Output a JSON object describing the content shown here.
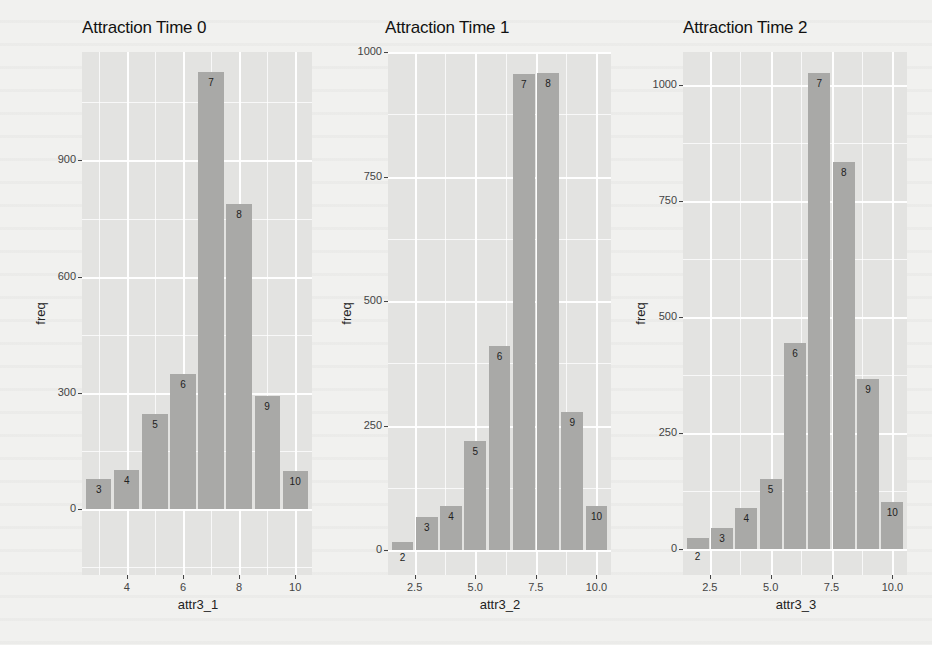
{
  "chart_data": [
    {
      "type": "bar",
      "title": "Attraction Time 0",
      "xlabel": "attr3_1",
      "ylabel": "freq",
      "categories": [
        3,
        4,
        5,
        6,
        7,
        8,
        9,
        10
      ],
      "values": [
        79,
        100,
        245,
        348,
        1129,
        788,
        293,
        98
      ],
      "bar_labels": [
        "3",
        "4",
        "5",
        "6",
        "7",
        "8",
        "9",
        "10"
      ],
      "xticks": [
        "4",
        "6",
        "8",
        "10"
      ],
      "yticks": [
        "0",
        "300",
        "600",
        "900"
      ],
      "xlim": [
        2.4,
        10.6
      ],
      "ylim": [
        -170,
        1180
      ],
      "grid": true
    },
    {
      "type": "bar",
      "title": "Attraction Time 1",
      "xlabel": "attr3_2",
      "ylabel": "freq",
      "categories": [
        2,
        3,
        4,
        5,
        6,
        7,
        8,
        9,
        10
      ],
      "values": [
        16,
        67,
        89,
        220,
        409,
        956,
        958,
        278,
        89
      ],
      "bar_labels": [
        "2",
        "3",
        "4",
        "5",
        "6",
        "7",
        "8",
        "9",
        "10"
      ],
      "xticks": [
        "2.5",
        "5.0",
        "7.5",
        "10.0"
      ],
      "yticks": [
        "0",
        "250",
        "500",
        "750",
        "1000"
      ],
      "xlim": [
        1.4,
        10.6
      ],
      "ylim": [
        -50,
        1000
      ],
      "grid": true
    },
    {
      "type": "bar",
      "title": "Attraction Time 2",
      "xlabel": "attr3_3",
      "ylabel": "freq",
      "categories": [
        2,
        3,
        4,
        5,
        6,
        7,
        8,
        9,
        10
      ],
      "values": [
        24,
        47,
        90,
        151,
        444,
        1024,
        834,
        366,
        103
      ],
      "bar_labels": [
        "2",
        "3",
        "4",
        "5",
        "6",
        "7",
        "8",
        "9",
        "10"
      ],
      "xticks": [
        "2.5",
        "5.0",
        "7.5",
        "10.0"
      ],
      "yticks": [
        "0",
        "250",
        "500",
        "750",
        "1000"
      ],
      "xlim": [
        1.4,
        10.6
      ],
      "ylim": [
        -55,
        1070
      ],
      "grid": true
    }
  ],
  "colors": {
    "panel_bg": "#e3e3e1",
    "bar_fill": "#a9a9a7",
    "page_bg": "#f1f1ef"
  }
}
